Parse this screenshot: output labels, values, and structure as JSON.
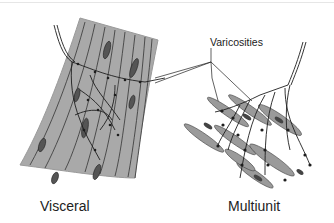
{
  "figure": {
    "labels": {
      "visceral": "Visceral",
      "multiunit": "Multiunit",
      "varicosities": "Varicosities"
    },
    "colors": {
      "muscle_fill": "#a9a9a9",
      "cell_fill": "#9a9a9a",
      "nucleus_fill": "#555555",
      "line": "#1e1e1e"
    }
  }
}
